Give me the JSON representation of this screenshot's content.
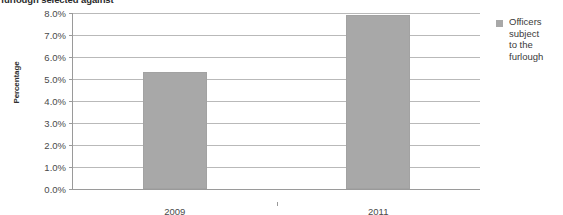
{
  "chart_data": {
    "type": "bar",
    "title": "furlough selected against",
    "title_clipped": true,
    "xlabel": "",
    "ylabel": "Percentage",
    "categories": [
      "2009",
      "2011"
    ],
    "series": [
      {
        "name": "Officers subject to the furlough",
        "values": [
          5.3,
          7.9
        ]
      }
    ],
    "values": [
      5.3,
      7.9
    ],
    "ylim": [
      0,
      8
    ],
    "ytick_values": [
      0,
      1,
      2,
      3,
      4,
      5,
      6,
      7,
      8
    ],
    "ytick_labels": [
      "0.0%",
      "1.0%",
      "2.0%",
      "3.0%",
      "4.0%",
      "5.0%",
      "6.0%",
      "7.0%",
      "8.0%"
    ],
    "grid": true,
    "legend_position": "right",
    "legend_entries": [
      "Officers subject to the furlough"
    ],
    "legend_lines": [
      "Officers",
      "subject",
      "to the",
      "furlough"
    ],
    "bar_color": "#a8a8a8",
    "gridline_color": "#b9b9b9",
    "axis_color": "#9a9a9a",
    "text_color": "#3a3a3a"
  }
}
